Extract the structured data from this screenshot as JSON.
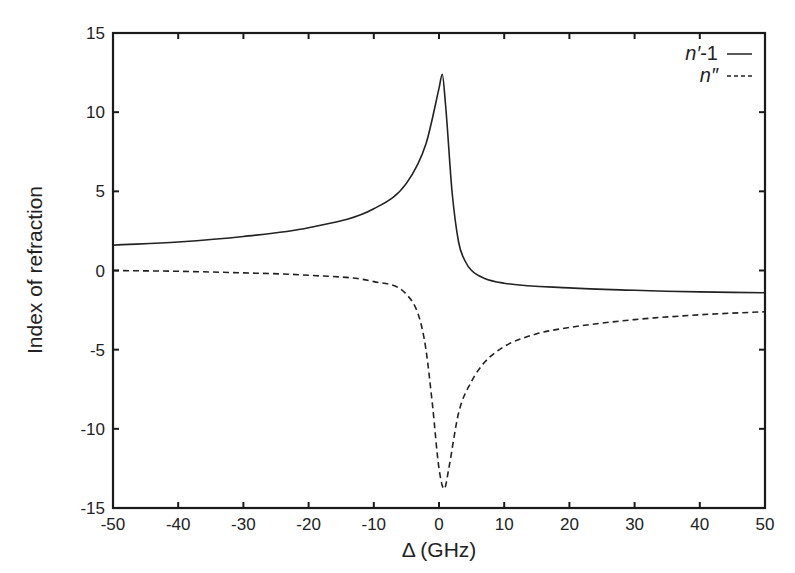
{
  "chart_data": {
    "type": "line",
    "title": "",
    "xlabel": "Δ (GHz)",
    "ylabel": "Index of refraction",
    "xlim": [
      -50,
      50
    ],
    "ylim": [
      -15,
      15
    ],
    "xticks": [
      -50,
      -40,
      -30,
      -20,
      -10,
      0,
      10,
      20,
      30,
      40,
      50
    ],
    "yticks": [
      -15,
      -10,
      -5,
      0,
      5,
      10,
      15
    ],
    "grid": false,
    "legend_position": "upper right",
    "series": [
      {
        "name": "n′-1",
        "style": "solid",
        "x": [
          -50,
          -40,
          -30,
          -20,
          -10,
          -5,
          -2,
          0,
          0.5,
          1,
          2,
          3,
          4,
          5,
          7,
          10,
          20,
          30,
          40,
          50
        ],
        "y": [
          1.6,
          1.8,
          2.15,
          2.7,
          3.9,
          5.5,
          8.0,
          11.5,
          12.4,
          10.5,
          5.0,
          1.8,
          0.6,
          0.0,
          -0.5,
          -0.8,
          -1.1,
          -1.25,
          -1.35,
          -1.4
        ]
      },
      {
        "name": "n″",
        "style": "dashed",
        "x": [
          -50,
          -40,
          -30,
          -20,
          -10,
          -5,
          -3,
          -2,
          -1,
          0,
          0.8,
          1.5,
          3,
          5,
          7,
          10,
          15,
          20,
          30,
          40,
          50
        ],
        "y": [
          0.0,
          -0.05,
          -0.15,
          -0.3,
          -0.7,
          -1.5,
          -3.0,
          -5.0,
          -8.5,
          -12.5,
          -13.8,
          -12.5,
          -9.0,
          -7.0,
          -5.8,
          -4.8,
          -4.0,
          -3.6,
          -3.1,
          -2.8,
          -2.6
        ]
      }
    ]
  },
  "legend": {
    "entries": [
      {
        "label_main": "n′",
        "label_suffix": "-1",
        "style": "solid"
      },
      {
        "label_main": "n″",
        "label_suffix": "",
        "style": "dashed"
      }
    ]
  },
  "colors": {
    "line": "#222222",
    "axis": "#1a1a1a",
    "background": "#ffffff"
  }
}
